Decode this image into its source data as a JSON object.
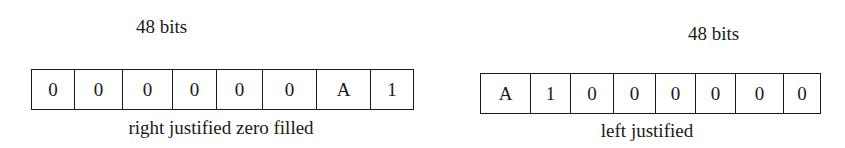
{
  "left_diagram": {
    "width_label": "48 bits",
    "cells": [
      "0",
      "0",
      "0",
      "0",
      "0",
      "0",
      "A",
      "1"
    ],
    "caption": "right justified zero filled"
  },
  "right_diagram": {
    "width_label": "48 bits",
    "cells": [
      "A",
      "1",
      "0",
      "0",
      "0",
      "0",
      "0",
      "0"
    ],
    "caption": "left justified"
  }
}
